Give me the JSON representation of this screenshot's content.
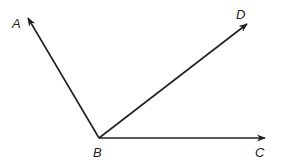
{
  "diagram": {
    "type": "angles",
    "stroke_color": "#231f20",
    "vertex": {
      "label": "B",
      "x": 99,
      "y": 138
    },
    "rays": [
      {
        "name": "BA",
        "label": "A",
        "tip": {
          "x": 27,
          "y": 17
        }
      },
      {
        "name": "BD",
        "label": "D",
        "tip": {
          "x": 248,
          "y": 23
        }
      },
      {
        "name": "BC",
        "label": "C",
        "tip": {
          "x": 266,
          "y": 138
        }
      }
    ]
  },
  "labels": {
    "A": "A",
    "B": "B",
    "C": "C",
    "D": "D"
  }
}
